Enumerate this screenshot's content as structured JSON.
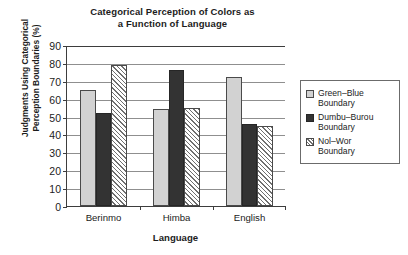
{
  "chart_data": {
    "type": "bar",
    "title": "Categorical Perception of Colors as a Function of Language",
    "title_lines": [
      "Categorical Perception of Colors as",
      "a Function of Language"
    ],
    "xlabel": "Language",
    "ylabel": "Judgments Using Categorical Perception Boundaries (%)",
    "ylabel_lines": [
      "Judgments Using Categorical",
      "Perception Boundaries (%)"
    ],
    "categories": [
      "Berinmo",
      "Himba",
      "English"
    ],
    "series": [
      {
        "name": "Green–Blue Boundary",
        "name_lines": [
          "Green–Blue",
          "Boundary"
        ],
        "fill": "light-gray",
        "color": "#d2d2d2",
        "values": [
          65,
          54,
          72
        ]
      },
      {
        "name": "Dumbu–Burou Boundary",
        "name_lines": [
          "Dumbu–Burou",
          "Boundary"
        ],
        "fill": "solid-dark",
        "color": "#333333",
        "values": [
          52,
          76,
          46
        ]
      },
      {
        "name": "Nol–Wor Boundary",
        "name_lines": [
          "Nol–Wor",
          "Boundary"
        ],
        "fill": "diagonal-hatch",
        "color": "#ffffff",
        "values": [
          79,
          55,
          45
        ]
      }
    ],
    "ylim": [
      0,
      90
    ],
    "yticks": [
      0,
      10,
      20,
      30,
      40,
      50,
      60,
      70,
      80,
      90
    ],
    "ytick_labels": [
      "0",
      "10",
      "20",
      "30",
      "40",
      "50",
      "60",
      "70",
      "80",
      "90"
    ],
    "grid": true,
    "grid_axis": "y",
    "legend_position": "right"
  }
}
